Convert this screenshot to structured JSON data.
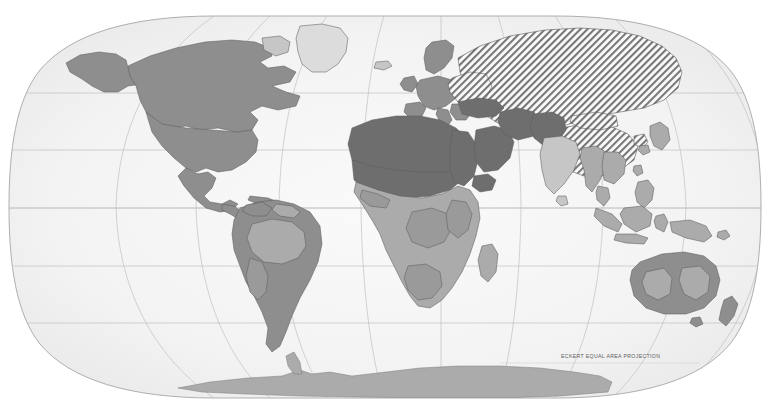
{
  "map": {
    "title": "World political map",
    "projection_caption": "ECKERT EQUAL AREA PROJECTION",
    "projection_name": "Eckert Equal Area Projection",
    "background_color": "#ffffff",
    "ocean_color": "#f4f4f4",
    "graticule_color": "#b9b9b9",
    "outline_color": "#9a9a9a",
    "coast_color": "#6a6a6a",
    "border_color": "#5a5a5a",
    "shading_classes": [
      {
        "id": "dark",
        "label": "Dark shaded region",
        "color": "#6e6e6e"
      },
      {
        "id": "medium",
        "label": "Medium shaded region",
        "color": "#8e8e8e"
      },
      {
        "id": "light",
        "label": "Light shaded region",
        "color": "#ababab"
      },
      {
        "id": "pale",
        "label": "Pale shaded region",
        "color": "#c6c6c6"
      },
      {
        "id": "vpale",
        "label": "Very pale shaded region",
        "color": "#dcdcdc"
      },
      {
        "id": "hatched",
        "label": "Diagonal hatched region",
        "color": "#8a8a8a"
      }
    ],
    "graticule": {
      "parallels_deg": [
        60,
        30,
        0,
        -30,
        -60
      ],
      "meridians_deg": [
        -180,
        -135,
        -90,
        -45,
        0,
        45,
        90,
        135,
        180
      ],
      "equator_deg": 0,
      "grid_visible": true
    },
    "regions": [
      {
        "name": "North America",
        "shading": "medium"
      },
      {
        "name": "Greenland",
        "shading": "vpale"
      },
      {
        "name": "Central America",
        "shading": "medium"
      },
      {
        "name": "Caribbean",
        "shading": "medium"
      },
      {
        "name": "South America",
        "shading": "medium"
      },
      {
        "name": "Amazon Basin",
        "shading": "light"
      },
      {
        "name": "Western Europe",
        "shading": "medium"
      },
      {
        "name": "Scandinavia",
        "shading": "medium"
      },
      {
        "name": "Eastern Europe",
        "shading": "hatched"
      },
      {
        "name": "Soviet Union",
        "shading": "hatched"
      },
      {
        "name": "China",
        "shading": "hatched"
      },
      {
        "name": "Mongolia",
        "shading": "hatched"
      },
      {
        "name": "North Africa",
        "shading": "dark"
      },
      {
        "name": "Sahel",
        "shading": "dark"
      },
      {
        "name": "Middle East",
        "shading": "dark"
      },
      {
        "name": "Arabian Peninsula",
        "shading": "dark"
      },
      {
        "name": "Iran",
        "shading": "dark"
      },
      {
        "name": "Afghanistan",
        "shading": "dark"
      },
      {
        "name": "Pakistan",
        "shading": "dark"
      },
      {
        "name": "Turkey",
        "shading": "dark"
      },
      {
        "name": "Sub-Saharan Africa",
        "shading": "light"
      },
      {
        "name": "Madagascar",
        "shading": "light"
      },
      {
        "name": "India",
        "shading": "pale"
      },
      {
        "name": "Southeast Asia",
        "shading": "light"
      },
      {
        "name": "Indonesia",
        "shading": "light"
      },
      {
        "name": "Philippines",
        "shading": "light"
      },
      {
        "name": "Japan",
        "shading": "light"
      },
      {
        "name": "Korea",
        "shading": "hatched"
      },
      {
        "name": "New Guinea",
        "shading": "light"
      },
      {
        "name": "Australia",
        "shading": "medium"
      },
      {
        "name": "Australian Interior",
        "shading": "light"
      },
      {
        "name": "New Zealand",
        "shading": "medium"
      },
      {
        "name": "Antarctica",
        "shading": "light"
      }
    ]
  }
}
